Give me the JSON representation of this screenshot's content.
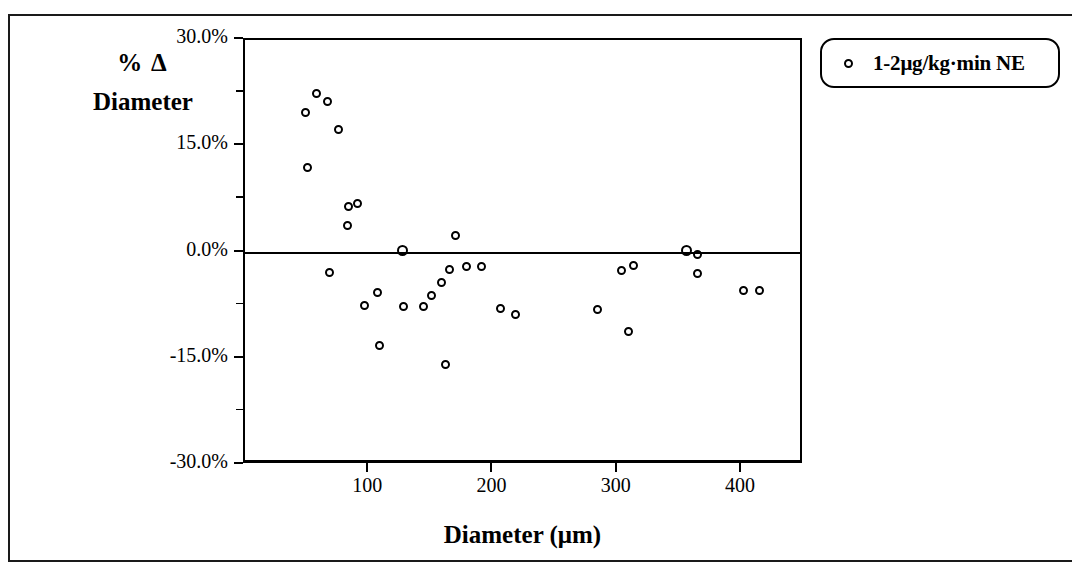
{
  "chart_data": {
    "type": "scatter",
    "title": "",
    "xlabel": "Diameter (μm)",
    "ylabel_line1": "% Δ",
    "ylabel_line2": "Diameter",
    "xlim": [
      0,
      450
    ],
    "ylim": [
      -30.0,
      30.0
    ],
    "grid": false,
    "legend_position": "top-right",
    "marker": "open-circle",
    "marker_color": "#000000",
    "x_ticks": [
      100,
      200,
      300,
      400
    ],
    "x_tick_labels": [
      "100",
      "200",
      "300",
      "400"
    ],
    "y_ticks": [
      30.0,
      15.0,
      0.0,
      -15.0,
      -30.0
    ],
    "y_tick_labels": [
      "30.0%",
      "15.0%",
      "0.0%",
      "-15.0%",
      "-30.0%"
    ],
    "y_minor_ticks": [
      22.5,
      7.5,
      -7.5,
      -22.5
    ],
    "series": [
      {
        "name": "1-2μg/kg·min NE",
        "points": [
          {
            "x": 50,
            "y": 19.5
          },
          {
            "x": 59,
            "y": 22.2
          },
          {
            "x": 68,
            "y": 21.0
          },
          {
            "x": 77,
            "y": 17.1
          },
          {
            "x": 52,
            "y": 11.7
          },
          {
            "x": 85,
            "y": 6.2
          },
          {
            "x": 92,
            "y": 6.7
          },
          {
            "x": 84,
            "y": 3.6
          },
          {
            "x": 70,
            "y": -3.1
          },
          {
            "x": 98,
            "y": -7.8
          },
          {
            "x": 108,
            "y": -5.9
          },
          {
            "x": 110,
            "y": -13.4
          },
          {
            "x": 128,
            "y": 0.0
          },
          {
            "x": 129,
            "y": -7.9
          },
          {
            "x": 145,
            "y": -7.9
          },
          {
            "x": 152,
            "y": -6.4
          },
          {
            "x": 160,
            "y": -4.5
          },
          {
            "x": 163,
            "y": -16.1
          },
          {
            "x": 171,
            "y": 2.1
          },
          {
            "x": 166,
            "y": -2.7
          },
          {
            "x": 180,
            "y": -2.2
          },
          {
            "x": 192,
            "y": -2.3
          },
          {
            "x": 207,
            "y": -8.2
          },
          {
            "x": 219,
            "y": -9.1
          },
          {
            "x": 285,
            "y": -8.3
          },
          {
            "x": 305,
            "y": -2.8
          },
          {
            "x": 314,
            "y": -2.1
          },
          {
            "x": 310,
            "y": -11.5
          },
          {
            "x": 357,
            "y": 0.0
          },
          {
            "x": 366,
            "y": -0.6
          },
          {
            "x": 366,
            "y": -3.2
          },
          {
            "x": 403,
            "y": -5.6
          },
          {
            "x": 416,
            "y": -5.6
          }
        ]
      }
    ]
  },
  "legend": {
    "marker_name": "open-circle-marker",
    "label": "1-2μg/kg·min NE"
  }
}
